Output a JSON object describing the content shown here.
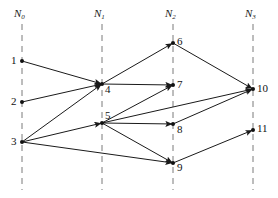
{
  "figure": {
    "type": "layered-network-diagram",
    "background_color": "#ffffff",
    "edge_color": "#1a1a1a",
    "guide_color": "#7a7a7a",
    "node_color": "#111111",
    "width": 278,
    "height": 198
  },
  "layers": [
    {
      "id": "N0",
      "label": "N",
      "subscript": "0",
      "x": 22,
      "label_x": 14,
      "label_y": 8
    },
    {
      "id": "N1",
      "label": "N",
      "subscript": "1",
      "x": 102,
      "label_x": 94,
      "label_y": 8
    },
    {
      "id": "N2",
      "label": "N",
      "subscript": "2",
      "x": 173,
      "label_x": 165,
      "label_y": 8
    },
    {
      "id": "N3",
      "label": "N",
      "subscript": "3",
      "x": 253,
      "label_x": 245,
      "label_y": 8
    }
  ],
  "guides": [
    {
      "name": "guide-N0",
      "x": 22,
      "y1": 24,
      "y2": 190
    },
    {
      "name": "guide-N1",
      "x": 102,
      "y1": 24,
      "y2": 190
    },
    {
      "name": "guide-N2",
      "x": 173,
      "y1": 24,
      "y2": 190
    },
    {
      "name": "guide-N3",
      "x": 253,
      "y1": 24,
      "y2": 190
    }
  ],
  "nodes": [
    {
      "id": 1,
      "label": "1",
      "layer": "N0",
      "x": 22,
      "y": 61,
      "label_x": 11,
      "label_y": 55
    },
    {
      "id": 2,
      "label": "2",
      "layer": "N0",
      "x": 22,
      "y": 102,
      "label_x": 11,
      "label_y": 96
    },
    {
      "id": 3,
      "label": "3",
      "layer": "N0",
      "x": 22,
      "y": 142,
      "label_x": 11,
      "label_y": 136
    },
    {
      "id": 4,
      "label": "4",
      "layer": "N1",
      "x": 102,
      "y": 84,
      "label_x": 105,
      "label_y": 84
    },
    {
      "id": 5,
      "label": "5",
      "layer": "N1",
      "x": 102,
      "y": 123,
      "label_x": 105,
      "label_y": 110
    },
    {
      "id": 6,
      "label": "6",
      "layer": "N2",
      "x": 173,
      "y": 43,
      "label_x": 177,
      "label_y": 36
    },
    {
      "id": 7,
      "label": "7",
      "layer": "N2",
      "x": 173,
      "y": 85,
      "label_x": 177,
      "label_y": 79
    },
    {
      "id": 8,
      "label": "8",
      "layer": "N2",
      "x": 173,
      "y": 124,
      "label_x": 177,
      "label_y": 124
    },
    {
      "id": 9,
      "label": "9",
      "layer": "N2",
      "x": 173,
      "y": 163,
      "label_x": 177,
      "label_y": 162
    },
    {
      "id": 10,
      "label": "10",
      "layer": "N3",
      "x": 253,
      "y": 89,
      "label_x": 257,
      "label_y": 83
    },
    {
      "id": 11,
      "label": "11",
      "layer": "N3",
      "x": 253,
      "y": 130,
      "label_x": 257,
      "label_y": 123
    }
  ],
  "edges": [
    {
      "name": "edge-1-4",
      "from": 1,
      "to": 4
    },
    {
      "name": "edge-2-4",
      "from": 2,
      "to": 4
    },
    {
      "name": "edge-3-4",
      "from": 3,
      "to": 4
    },
    {
      "name": "edge-3-5",
      "from": 3,
      "to": 5
    },
    {
      "name": "edge-3-9",
      "from": 3,
      "to": 9
    },
    {
      "name": "edge-4-6",
      "from": 4,
      "to": 6
    },
    {
      "name": "edge-4-7",
      "from": 4,
      "to": 7
    },
    {
      "name": "edge-5-7",
      "from": 5,
      "to": 7
    },
    {
      "name": "edge-5-8",
      "from": 5,
      "to": 8
    },
    {
      "name": "edge-5-9",
      "from": 5,
      "to": 9
    },
    {
      "name": "edge-5-10",
      "from": 5,
      "to": 10
    },
    {
      "name": "edge-6-10",
      "from": 6,
      "to": 10
    },
    {
      "name": "edge-8-10",
      "from": 8,
      "to": 10
    },
    {
      "name": "edge-9-11",
      "from": 9,
      "to": 11
    }
  ]
}
